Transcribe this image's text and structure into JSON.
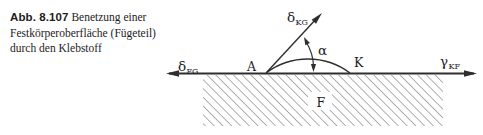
{
  "figure": {
    "caption": {
      "label": "Abb. 8.107",
      "lines": [
        "Benetzung einer",
        "Festkörperoberfläche (Fügeteil)",
        "durch den Klebstoff"
      ]
    },
    "diagram": {
      "surface_tension_left": {
        "symbol": "δ",
        "sub": "FG"
      },
      "surface_tension_up": {
        "symbol": "δ",
        "sub": "KG"
      },
      "surface_tension_right": {
        "symbol": "γ",
        "sub": "KF"
      },
      "contact_angle": "α",
      "point_left": "A",
      "point_right": "K",
      "solid_region": "F"
    },
    "colors": {
      "stroke": "#2e2e2e",
      "hatch": "#5f5f5f",
      "text": "#1c1c1c"
    }
  }
}
